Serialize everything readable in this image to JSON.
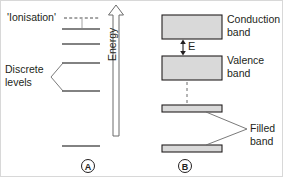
{
  "figure": {
    "stroke_color": "#231f20",
    "band_fill": "#d9d9d9",
    "background": "#ffffff"
  },
  "panel_a": {
    "marker": "A",
    "ionisation_label": "'Ionisation'",
    "discrete_label": "Discrete\nlevels",
    "energy_axis_label": "Energy",
    "levels": [
      {
        "name": "ionisation-line",
        "style": "dashed",
        "y": 17
      },
      {
        "name": "level-1",
        "style": "solid",
        "y": 28
      },
      {
        "name": "level-2",
        "style": "solid",
        "y": 43
      },
      {
        "name": "level-3",
        "style": "solid",
        "y": 62
      },
      {
        "name": "level-4",
        "style": "solid",
        "y": 90
      },
      {
        "name": "ground-level",
        "style": "solid",
        "y": 145
      }
    ]
  },
  "panel_b": {
    "marker": "B",
    "bands": [
      {
        "name": "conduction-band",
        "label": "Conduction\nband",
        "y": 14,
        "height": 24,
        "kind": "box"
      },
      {
        "name": "valence-band",
        "label": "Valence\nband",
        "y": 55,
        "height": 24,
        "kind": "box"
      },
      {
        "name": "filled-band-upper",
        "label": "",
        "y": 104,
        "height": 7,
        "kind": "bar"
      },
      {
        "name": "filled-band-lower",
        "label": "",
        "y": 144,
        "height": 7,
        "kind": "bar"
      }
    ],
    "gap_label": "E",
    "filled_label": "Filled\nband"
  }
}
